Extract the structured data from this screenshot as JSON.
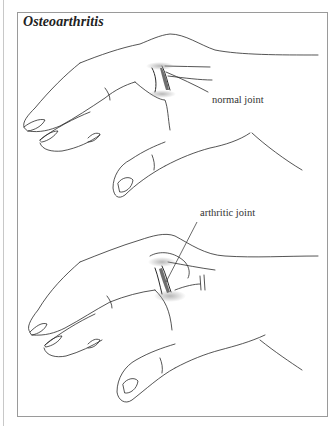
{
  "figure": {
    "title": "Osteoarthritis",
    "panels": [
      {
        "name": "top",
        "label": "normal joint",
        "joint_state": "normal"
      },
      {
        "name": "bottom",
        "label": "arthritic joint",
        "joint_state": "arthritic"
      }
    ]
  },
  "colors": {
    "line": "#2a2a2a",
    "frame": "#9a9a9a",
    "shading": "#9a9a9a",
    "cartilage": "#6e6e6e"
  }
}
